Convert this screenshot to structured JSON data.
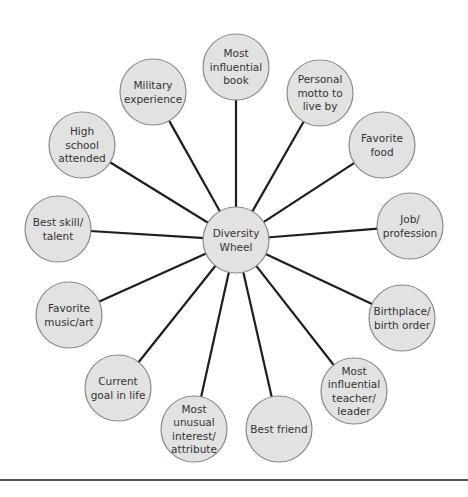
{
  "diagram": {
    "colors": {
      "node_fill": "#e2e2e2",
      "node_stroke": "#8a8a8a",
      "spoke": "#1e1e1e",
      "text": "#333333",
      "rule": "#555555"
    },
    "hub": {
      "label_lines": [
        "Diversity",
        "Wheel"
      ],
      "cx": 236,
      "cy": 240,
      "r": 33
    },
    "nodes": [
      {
        "id": "most-influential-book",
        "label_lines": [
          "Most",
          "influential",
          "book"
        ],
        "cx": 236,
        "cy": 67
      },
      {
        "id": "personal-motto",
        "label_lines": [
          "Personal",
          "motto to",
          "live by"
        ],
        "cx": 320,
        "cy": 93
      },
      {
        "id": "favorite-food",
        "label_lines": [
          "Favorite",
          "food"
        ],
        "cx": 382,
        "cy": 145
      },
      {
        "id": "job-profession",
        "label_lines": [
          "Job/",
          "profession"
        ],
        "cx": 410,
        "cy": 226
      },
      {
        "id": "birthplace-birth-order",
        "label_lines": [
          "Birthplace/",
          "birth order"
        ],
        "cx": 402,
        "cy": 318
      },
      {
        "id": "most-influential-teacher",
        "label_lines": [
          "Most",
          "influential",
          "teacher/",
          "leader"
        ],
        "cx": 354,
        "cy": 391
      },
      {
        "id": "best-friend",
        "label_lines": [
          "Best friend"
        ],
        "cx": 279,
        "cy": 429
      },
      {
        "id": "most-unusual-interest",
        "label_lines": [
          "Most",
          "unusual",
          "interest/",
          "attribute"
        ],
        "cx": 194,
        "cy": 429
      },
      {
        "id": "current-goal",
        "label_lines": [
          "Current",
          "goal in life"
        ],
        "cx": 118,
        "cy": 388
      },
      {
        "id": "favorite-music-art",
        "label_lines": [
          "Favorite",
          "music/art"
        ],
        "cx": 69,
        "cy": 315
      },
      {
        "id": "best-skill-talent",
        "label_lines": [
          "Best skill/",
          "talent"
        ],
        "cx": 58,
        "cy": 229
      },
      {
        "id": "high-school",
        "label_lines": [
          "High",
          "school",
          "attended"
        ],
        "cx": 82,
        "cy": 145
      },
      {
        "id": "military-experience",
        "label_lines": [
          "Military",
          "experience"
        ],
        "cx": 153,
        "cy": 92
      }
    ],
    "node_radius": 33
  }
}
